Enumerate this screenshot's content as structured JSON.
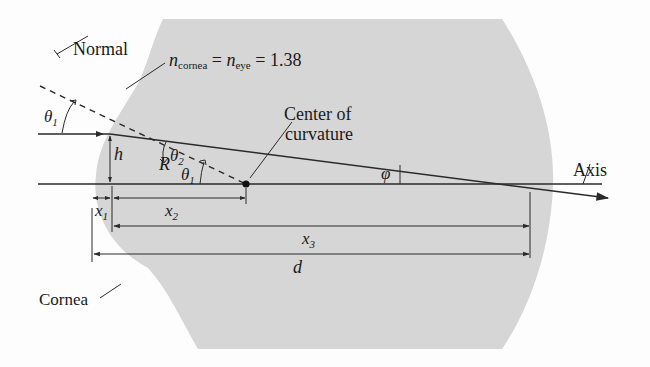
{
  "diagram": {
    "colors": {
      "eye_fill": "#d6d6d6",
      "line": "#2a2a2a",
      "background": "#fdfdfd"
    },
    "labels": {
      "normal": "Normal",
      "index_n": "n",
      "index_sub_cornea": "cornea",
      "index_eq1": " = ",
      "index_n2": "n",
      "index_sub_eye": "eye",
      "index_eq2": " = 1.38",
      "center_line1": "Center of",
      "center_line2": "curvature",
      "axis": "Axis",
      "cornea": "Cornea",
      "theta": "θ",
      "theta1_sub": "1",
      "theta2_sub": "2",
      "h": "h",
      "R": "R",
      "phi": "φ",
      "x": "x",
      "x1_sub": "1",
      "x2_sub": "2",
      "x3_sub": "3",
      "d": "d"
    },
    "quantities": {
      "n_cornea": 1.38,
      "n_eye": 1.38
    },
    "elements": [
      "incident-ray",
      "refracted-ray",
      "normal-line",
      "optical-axis",
      "center-of-curvature",
      "dimension-x1",
      "dimension-x2",
      "dimension-x3",
      "dimension-d",
      "height-h",
      "radius-R",
      "angle-theta1-incident",
      "angle-theta2",
      "angle-theta1-center",
      "angle-phi"
    ]
  }
}
